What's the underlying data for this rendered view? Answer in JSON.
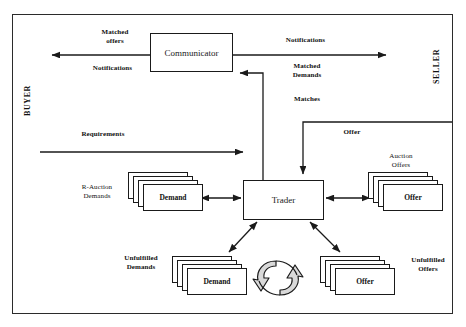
{
  "diagram": {
    "frame": {
      "x": 12,
      "y": 14,
      "width": 441,
      "height": 300
    },
    "side_labels": {
      "buyer": "BUYER",
      "seller": "SELLER"
    },
    "nodes": [
      {
        "id": "communicator",
        "label": "Communicator",
        "x": 150,
        "y": 33,
        "width": 83,
        "height": 39
      },
      {
        "id": "trader",
        "label": "Trader",
        "x": 243,
        "y": 180,
        "width": 81,
        "height": 40
      }
    ],
    "stacks": [
      {
        "id": "r-auction-demands",
        "label": "Demand",
        "caption": "R-Auction\nDemands",
        "x": 138,
        "y": 180,
        "width": 60,
        "height": 27,
        "sheets": 3
      },
      {
        "id": "auction-offers",
        "label": "Offer",
        "caption": "Auction\nOffers",
        "x": 378,
        "y": 180,
        "width": 60,
        "height": 27,
        "sheets": 3
      },
      {
        "id": "unfulfilled-demands",
        "label": "Demand",
        "caption": "Unfulfilled\nDemands",
        "x": 182,
        "y": 264,
        "width": 60,
        "height": 27,
        "sheets": 3
      },
      {
        "id": "unfulfilled-offers",
        "label": "Offer",
        "caption": "Unfulfilled\nOffers",
        "x": 330,
        "y": 264,
        "width": 60,
        "height": 27,
        "sheets": 3
      }
    ],
    "edge_labels": {
      "matched_offers": "Matched\noffers",
      "notifications_left": "Notifications",
      "notifications_right": "Notifications",
      "matched_demands": "Matched\nDemands",
      "matches": "Matches",
      "requirements": "Requirements",
      "offer": "Offer"
    },
    "captions": {
      "r_auction_demands": "R-Auction\nDemands",
      "auction_offers": "Auction\nOffers",
      "unfulfilled_demands": "Unfulfilled\nDemands",
      "unfulfilled_offers": "Unfulfilled\nOffers"
    },
    "recycle_icon": {
      "name": "recycle-cycle-icon",
      "cx": 278,
      "cy": 278
    },
    "colors": {
      "line": "#1a1a1a",
      "frame": "#2b2b2b",
      "text": "#111111",
      "background": "#ffffff",
      "recycle_fill": "#d9d9d9"
    }
  }
}
